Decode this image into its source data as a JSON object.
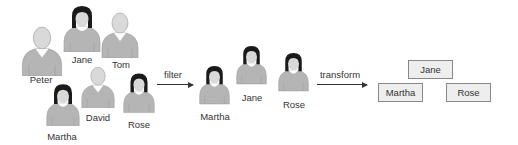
{
  "colors": {
    "body": "#b5b5b5",
    "head": "#d9d9d9",
    "hair": "#1a1a1a",
    "collar": "#ffffff",
    "outline": "#9a9a9a",
    "text": "#333333",
    "box_fill": "#eeeeee",
    "box_border": "#888888"
  },
  "groups": {
    "source": {
      "people": [
        {
          "name": "Peter",
          "type": "male"
        },
        {
          "name": "Jane",
          "type": "female"
        },
        {
          "name": "Tom",
          "type": "male"
        },
        {
          "name": "Martha",
          "type": "female"
        },
        {
          "name": "David",
          "type": "male"
        },
        {
          "name": "Rose",
          "type": "female"
        }
      ]
    },
    "filtered": {
      "people": [
        {
          "name": "Martha",
          "type": "female"
        },
        {
          "name": "Jane",
          "type": "female"
        },
        {
          "name": "Rose",
          "type": "female"
        }
      ]
    },
    "transformed": {
      "boxes": [
        {
          "label": "Jane"
        },
        {
          "label": "Martha"
        },
        {
          "label": "Rose"
        }
      ]
    }
  },
  "arrows": {
    "filter": {
      "label": "filter"
    },
    "transform": {
      "label": "transform"
    }
  }
}
